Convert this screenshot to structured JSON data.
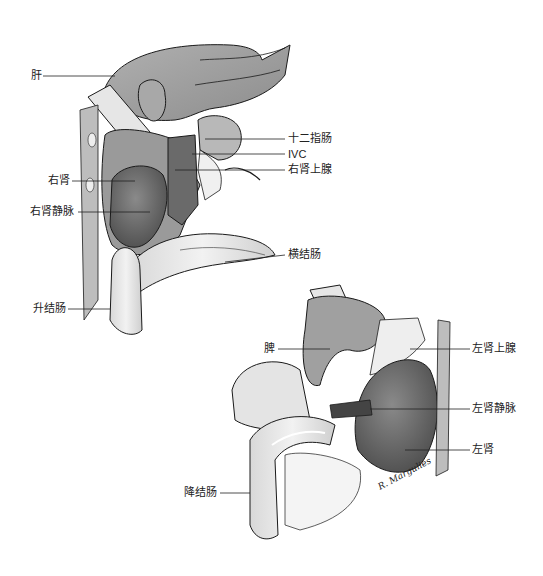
{
  "figure": {
    "top_panel": {
      "title": "Right kidney exposure",
      "labels": [
        {
          "id": "liver",
          "text": "肝",
          "x": 31,
          "y": 70
        },
        {
          "id": "duodenum",
          "text": "十二指肠",
          "x": 288,
          "y": 133
        },
        {
          "id": "ivc",
          "text": "IVC",
          "x": 288,
          "y": 148
        },
        {
          "id": "right-adrenal",
          "text": "右肾上腺",
          "x": 288,
          "y": 165
        },
        {
          "id": "right-kidney",
          "text": "右肾",
          "x": 48,
          "y": 176
        },
        {
          "id": "right-renal-vein",
          "text": "右肾静脉",
          "x": 30,
          "y": 206
        },
        {
          "id": "transverse-colon",
          "text": "横结肠",
          "x": 288,
          "y": 250
        },
        {
          "id": "ascending-colon",
          "text": "升结肠",
          "x": 33,
          "y": 303
        }
      ]
    },
    "bottom_panel": {
      "title": "Left kidney exposure",
      "labels": [
        {
          "id": "spleen",
          "text": "脾",
          "x": 264,
          "y": 344
        },
        {
          "id": "left-adrenal",
          "text": "左肾上腺",
          "x": 472,
          "y": 344
        },
        {
          "id": "left-renal-vein",
          "text": "左肾静脉",
          "x": 472,
          "y": 404
        },
        {
          "id": "left-kidney",
          "text": "左肾",
          "x": 472,
          "y": 445
        },
        {
          "id": "descending-colon",
          "text": "降结肠",
          "x": 192,
          "y": 487
        }
      ],
      "signature": "R. Margulies"
    },
    "colors": {
      "organ_dark": "#5a5a5a",
      "organ_mid": "#9a9a9a",
      "organ_light": "#c8c8c8",
      "outline": "#1a1a1a",
      "leader": "#222222"
    }
  }
}
